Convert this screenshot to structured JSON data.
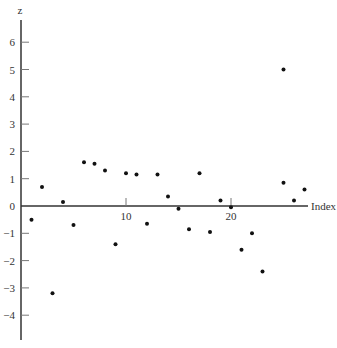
{
  "chart_data": {
    "type": "scatter",
    "title": "",
    "xlabel": "Index",
    "ylabel": "z",
    "xlim": [
      0,
      27.5
    ],
    "ylim": [
      -5,
      7
    ],
    "x_ticks": [
      10,
      20
    ],
    "y_ticks": [
      -4,
      -3,
      -2,
      -1,
      0,
      1,
      2,
      3,
      4,
      5,
      6
    ],
    "x_tick_labels": [
      "10",
      "20"
    ],
    "y_tick_labels": [
      "−4",
      "−3",
      "−2",
      "−1",
      "0",
      "1",
      "2",
      "3",
      "4",
      "5",
      "6"
    ],
    "grid": false,
    "legend": null,
    "points": [
      {
        "x": 1,
        "y": -0.5
      },
      {
        "x": 2,
        "y": 0.7
      },
      {
        "x": 3,
        "y": -3.2
      },
      {
        "x": 4,
        "y": 0.15
      },
      {
        "x": 5,
        "y": -0.7
      },
      {
        "x": 6,
        "y": 1.6
      },
      {
        "x": 7,
        "y": 1.55
      },
      {
        "x": 8,
        "y": 1.3
      },
      {
        "x": 9,
        "y": -1.4
      },
      {
        "x": 10,
        "y": 1.2
      },
      {
        "x": 11,
        "y": 1.15
      },
      {
        "x": 12,
        "y": -0.65
      },
      {
        "x": 13,
        "y": 1.15
      },
      {
        "x": 14,
        "y": 0.35
      },
      {
        "x": 15,
        "y": -0.1
      },
      {
        "x": 16,
        "y": -0.85
      },
      {
        "x": 17,
        "y": 1.2
      },
      {
        "x": 18,
        "y": -0.95
      },
      {
        "x": 19,
        "y": 0.2
      },
      {
        "x": 20,
        "y": -0.05
      },
      {
        "x": 21,
        "y": -1.6
      },
      {
        "x": 22,
        "y": -1.0
      },
      {
        "x": 23,
        "y": -2.4
      },
      {
        "x": 25,
        "y": 5.0
      },
      {
        "x": 25,
        "y": 0.85
      },
      {
        "x": 26,
        "y": 0.2
      },
      {
        "x": 27,
        "y": 0.6
      }
    ]
  },
  "layout": {
    "origin_px": [
      21,
      206
    ],
    "px_per_x": 10.5,
    "px_per_y": 27.3,
    "y_axis_top_px": 20,
    "y_axis_bottom_px": 340,
    "x_axis_right_px": 308,
    "point_color": "#111111",
    "axis_color": "#333333"
  }
}
